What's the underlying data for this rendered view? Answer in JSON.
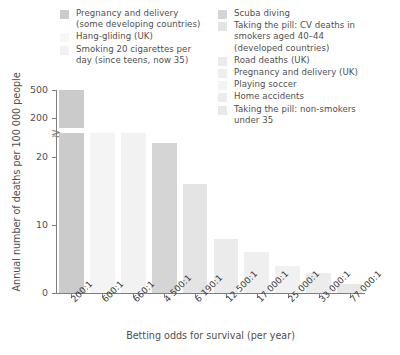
{
  "chart_data": {
    "type": "bar",
    "title": "",
    "xlabel": "Betting odds for survival (per year)",
    "ylabel": "Annual number of deaths per 100 000 people",
    "categories": [
      "200:1",
      "600:1",
      "660:1",
      "4 500:1",
      "6 190:1",
      "12 500:1",
      "17 000:1",
      "25 000:1",
      "33 000:1",
      "77 000:1"
    ],
    "values": [
      500,
      167,
      152,
      22,
      16,
      8,
      6,
      4,
      3,
      1.3
    ],
    "grid": false,
    "legend_position": "top",
    "y_broken_axis": true,
    "y_ticks_lower": [
      "0",
      "10",
      "20"
    ],
    "y_ticks_upper": [
      "200",
      "500"
    ],
    "ylim_lower": [
      0,
      23
    ],
    "ylim_upper": [
      190,
      520
    ],
    "series": [
      {
        "name": "Pregnancy and delivery (some developing countries)",
        "value": 500,
        "odds": "200:1",
        "color": "#cbcbcb"
      },
      {
        "name": "Hang-gliding (UK)",
        "value": 167,
        "odds": "600:1",
        "color": "#f4f4f4"
      },
      {
        "name": "Smoking 20 cigarettes per day (since teens, now 35)",
        "value": 152,
        "odds": "660:1",
        "color": "#f2f2f2"
      },
      {
        "name": "Scuba diving",
        "value": 22,
        "odds": "4 500:1",
        "color": "#d5d5d5"
      },
      {
        "name": "Taking the pill: CV deaths in smokers aged 40–44 (developed countries)",
        "value": 16,
        "odds": "6 190:1",
        "color": "#e4e4e4"
      },
      {
        "name": "Road deaths (UK)",
        "value": 8,
        "odds": "12 500:1",
        "color": "#ebebeb"
      },
      {
        "name": "Pregnancy and delivery (UK)",
        "value": 6,
        "odds": "17 000:1",
        "color": "#efefef"
      },
      {
        "name": "Playing soccer",
        "value": 4,
        "odds": "25 000:1",
        "color": "#f1f1f1"
      },
      {
        "name": "Home accidents",
        "value": 3,
        "odds": "33 000:1",
        "color": "#ececec"
      },
      {
        "name": "Taking the pill: non-smokers under 35",
        "value": 1.3,
        "odds": "77 000:1",
        "color": "#e8e8e8"
      }
    ]
  },
  "legend": {
    "left_column": [
      {
        "label": "Pregnancy and delivery\n(some developing countries)",
        "color": "#cbcbcb"
      },
      {
        "label": "Hang-gliding (UK)",
        "color": "#f7f7f7"
      },
      {
        "label": "Smoking 20 cigarettes per\nday (since teens, now 35)",
        "color": "#f2f2f2"
      }
    ],
    "right_column": [
      {
        "label": "Scuba diving",
        "color": "#d5d5d5"
      },
      {
        "label": "Taking the pill: CV deaths in\nsmokers aged 40–44\n(developed countries)",
        "color": "#e4e4e4"
      },
      {
        "label": "Road deaths (UK)",
        "color": "#ebebeb"
      },
      {
        "label": "Pregnancy and delivery (UK)",
        "color": "#eeeeee"
      },
      {
        "label": "Playing soccer",
        "color": "#f4f4f4"
      },
      {
        "label": "Home accidents",
        "color": "#ececec"
      },
      {
        "label": "Taking the pill: non-smokers\nunder 35",
        "color": "#e8e8e8"
      }
    ]
  },
  "axes": {
    "y_title": "Annual number of deaths per 100 000 people",
    "x_title": "Betting odds for survival (per year)",
    "y_tick_labels": [
      "500",
      "200",
      "20",
      "10",
      "0"
    ],
    "x_tick_labels": [
      "200:1",
      "600:1",
      "660:1",
      "4 500:1",
      "6 190:1",
      "12 500:1",
      "17 000:1",
      "25 000:1",
      "33 000:1",
      "77 000:1"
    ],
    "break_symbol": "≈"
  }
}
